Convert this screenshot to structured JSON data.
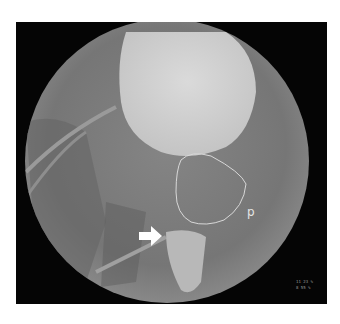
{
  "image": {
    "type": "fluoroscopy",
    "description": "Circular fluoroscopic field showing contrast-filled bladder with outlined prostate region and white arrow marker",
    "labels": {
      "outline_label": "p"
    },
    "annotation_lines": [
      "11 23 %",
      "8 55 %"
    ],
    "colors": {
      "background": "#050505",
      "field": "#7a7a7a",
      "contrast": "#d2d2d2",
      "outline": "#dcdcdc",
      "arrow": "#ffffff"
    }
  }
}
